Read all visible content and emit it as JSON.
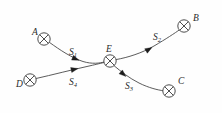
{
  "diagram": {
    "type": "node-link-diagram",
    "background_color": "#fefefe",
    "line_color": "#4a4a4a",
    "label_color": "#2a2a2a",
    "nodes": [
      {
        "id": "A",
        "label": "A",
        "glyph": "circled-cross",
        "cx": 44,
        "cy": 39,
        "r": 6.2,
        "label_x": 32,
        "label_y": 35
      },
      {
        "id": "B",
        "label": "B",
        "glyph": "circled-cross",
        "cx": 184,
        "cy": 26,
        "r": 6.2,
        "label_x": 193,
        "label_y": 21
      },
      {
        "id": "C",
        "label": "C",
        "glyph": "circled-cross",
        "cx": 169,
        "cy": 91,
        "r": 6.2,
        "label_x": 178,
        "label_y": 84
      },
      {
        "id": "D",
        "label": "D",
        "glyph": "circled-cross",
        "cx": 30,
        "cy": 80,
        "r": 6.2,
        "label_x": 16,
        "label_y": 87
      },
      {
        "id": "E",
        "label": "E",
        "glyph": "circled-cross",
        "cx": 110,
        "cy": 61,
        "r": 6.2,
        "label_x": 106,
        "label_y": 52
      }
    ],
    "edges": [
      {
        "id": "S1",
        "label_base": "S",
        "label_sub": "1",
        "from": "A",
        "to": "E",
        "label_x": 69,
        "label_y": 55,
        "path": "M 49.6 42.5 C 60 50 72 58 83 61.5 C 92 64.3 100 63.2 104.2 62.0",
        "arrow_x": 79,
        "arrow_y": 60.3,
        "arrow_angle": 22
      },
      {
        "id": "S2",
        "label_base": "S",
        "label_sub": "2",
        "from": "E",
        "to": "B",
        "label_x": 153,
        "label_y": 40,
        "path": "M 116.0 59.6 C 128 57.5 142 53 154 46 C 166 39 175 33 179.5 29.8",
        "arrow_x": 152,
        "arrow_y": 47.4,
        "arrow_angle": -31
      },
      {
        "id": "S3",
        "label_base": "S",
        "label_sub": "3",
        "from": "E",
        "to": "C",
        "label_x": 125,
        "label_y": 89,
        "path": "M 114.4 66.0 C 121 71.5 129 78 139 83 C 149 88 158 90 163 90.7",
        "arrow_x": 126,
        "arrow_y": 76.5,
        "arrow_angle": 41
      },
      {
        "id": "S4",
        "label_base": "S",
        "label_sub": "4",
        "from": "D",
        "to": "E",
        "label_x": 69,
        "label_y": 85,
        "path": "M 36.1 78.5 C 52 74.9 72 69.8 90 65.8 C 97 64.2 101.5 63.1 104.3 62.4",
        "arrow_x": 78,
        "arrow_y": 68.5,
        "arrow_angle": -13
      }
    ]
  }
}
